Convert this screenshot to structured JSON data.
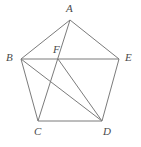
{
  "figure": {
    "background_color": "#ffffff",
    "stroke_color": "#7b7b7b",
    "label_color": "#4a4a4a",
    "stroke_width": 1,
    "width": 141,
    "height": 147
  },
  "points": {
    "A": {
      "label": "A",
      "x": 70,
      "y": 20,
      "label_x": 66,
      "label_y": 3
    },
    "B": {
      "label": "B",
      "x": 21,
      "y": 59,
      "label_x": 6,
      "label_y": 52
    },
    "C": {
      "label": "C",
      "x": 38,
      "y": 121,
      "label_x": 34,
      "label_y": 126
    },
    "D": {
      "label": "D",
      "x": 102,
      "y": 121,
      "label_x": 103,
      "label_y": 126
    },
    "E": {
      "label": "E",
      "x": 119,
      "y": 59,
      "label_x": 125,
      "label_y": 52
    },
    "F": {
      "label": "F",
      "x": 58,
      "y": 59,
      "label_x": 53,
      "label_y": 44
    }
  },
  "edges": [
    {
      "name": "segment-A-B",
      "from": "A",
      "to": "B"
    },
    {
      "name": "segment-A-E",
      "from": "A",
      "to": "E"
    },
    {
      "name": "segment-B-C",
      "from": "B",
      "to": "C"
    },
    {
      "name": "segment-C-D",
      "from": "C",
      "to": "D"
    },
    {
      "name": "segment-D-E",
      "from": "D",
      "to": "E"
    },
    {
      "name": "segment-B-E",
      "from": "B",
      "to": "E"
    },
    {
      "name": "segment-A-C",
      "from": "A",
      "to": "C"
    },
    {
      "name": "segment-B-D",
      "from": "B",
      "to": "D"
    },
    {
      "name": "segment-F-D",
      "from": "F",
      "to": "D"
    }
  ]
}
